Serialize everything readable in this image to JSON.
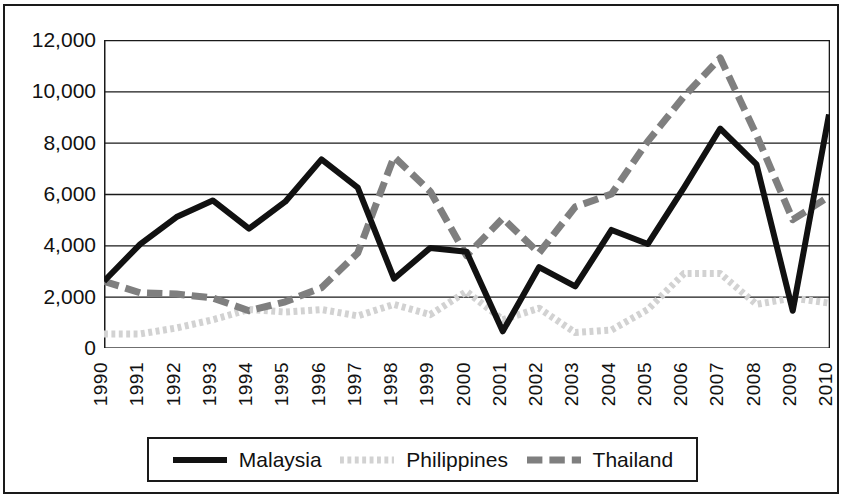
{
  "chart_data": {
    "type": "line",
    "title": "",
    "subtitle": "",
    "xlabel": "",
    "ylabel": "",
    "grid": true,
    "legend_position": "bottom",
    "xlim": [
      1990,
      2010
    ],
    "ylim": [
      0,
      12000
    ],
    "y_ticks": [
      0,
      2000,
      4000,
      6000,
      8000,
      10000,
      12000
    ],
    "y_tick_labels": [
      "0",
      "2,000",
      "4,000",
      "6,000",
      "8,000",
      "10,000",
      "12,000"
    ],
    "categories": [
      1990,
      1991,
      1992,
      1993,
      1994,
      1995,
      1996,
      1997,
      1998,
      1999,
      2000,
      2001,
      2002,
      2003,
      2004,
      2005,
      2006,
      2007,
      2008,
      2009,
      2010
    ],
    "x_tick_labels": [
      "1990",
      "1991",
      "1992",
      "1993",
      "1994",
      "1995",
      "1996",
      "1997",
      "1998",
      "1999",
      "2000",
      "2001",
      "2002",
      "2003",
      "2004",
      "2005",
      "2006",
      "2007",
      "2008",
      "2009",
      "2010"
    ],
    "series": [
      {
        "name": "Malaysia",
        "color": "#111111",
        "style": "solid",
        "width": 6,
        "values": [
          2600,
          4050,
          5100,
          5750,
          4650,
          5700,
          7350,
          6250,
          2700,
          3900,
          3750,
          650,
          3150,
          2400,
          4600,
          4050,
          6250,
          8550,
          7150,
          1450,
          9100
        ]
      },
      {
        "name": "Philippines",
        "color": "#d2d2d2",
        "style": "dotted",
        "width": 7,
        "values": [
          550,
          550,
          780,
          1100,
          1500,
          1400,
          1500,
          1250,
          1700,
          1300,
          2200,
          1100,
          1550,
          600,
          700,
          1500,
          2900,
          2900,
          1700,
          1950,
          1750
        ]
      },
      {
        "name": "Thailand",
        "color": "#7f7f7f",
        "style": "dashed",
        "width": 7,
        "values": [
          2600,
          2150,
          2100,
          1950,
          1450,
          1800,
          2350,
          3700,
          7450,
          6100,
          3600,
          5050,
          3700,
          5500,
          6000,
          8050,
          9800,
          11300,
          8300,
          5000,
          5900
        ]
      }
    ]
  },
  "legend": {
    "items": [
      {
        "label": "Malaysia",
        "color": "#111111",
        "style": "solid"
      },
      {
        "label": "Philippines",
        "color": "#d2d2d2",
        "style": "dotted"
      },
      {
        "label": "Thailand",
        "color": "#7f7f7f",
        "style": "dashed"
      }
    ]
  }
}
